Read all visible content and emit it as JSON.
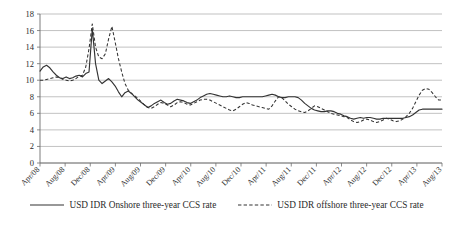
{
  "chart_data": {
    "type": "line",
    "title": "",
    "subtitle": "",
    "xlabel": "",
    "ylabel": "",
    "ylim": [
      0,
      18
    ],
    "ytick_step": 2,
    "yticks": [
      "0",
      "2",
      "4",
      "6",
      "8",
      "10",
      "12",
      "14",
      "16",
      "18"
    ],
    "grid": true,
    "grid_axis": "y",
    "legend_position": "bottom-center",
    "x_tick_labels": [
      "Apr/08",
      "Aug/08",
      "Dec/08",
      "Apr/09",
      "Aug/09",
      "Dec/09",
      "Apr/10",
      "Aug/10",
      "Dec/10",
      "Apr/11",
      "Aug/11",
      "Dec/11",
      "Apr/12",
      "Aug/12",
      "Dec/12",
      "Apr/13",
      "Aug/13"
    ],
    "x_tick_interval_months": 4,
    "x_start": "Apr/08",
    "x_end": "Aug/13",
    "series": [
      {
        "name": "USD IDR Onshore three-year CCS rate",
        "style": "solid",
        "color": "#333333",
        "values": [
          11.1,
          11.6,
          11.8,
          11.5,
          11.0,
          10.6,
          10.3,
          10.2,
          10.4,
          10.2,
          10.3,
          10.5,
          10.6,
          10.4,
          10.8,
          11.0,
          16.2,
          12.0,
          10.0,
          9.6,
          9.9,
          10.2,
          9.8,
          9.3,
          8.6,
          8.0,
          8.5,
          8.7,
          8.4,
          8.0,
          7.6,
          7.3,
          7.0,
          6.7,
          6.9,
          7.2,
          7.4,
          7.6,
          7.3,
          7.1,
          7.2,
          7.5,
          7.7,
          7.6,
          7.5,
          7.3,
          7.2,
          7.4,
          7.6,
          7.9,
          8.1,
          8.3,
          8.4,
          8.3,
          8.2,
          8.1,
          8.0,
          8.0,
          8.1,
          8.0,
          7.9,
          7.9,
          8.0,
          8.0,
          8.0,
          8.0,
          8.0,
          8.0,
          8.0,
          8.1,
          8.2,
          8.3,
          8.2,
          8.0,
          7.9,
          7.9,
          8.0,
          8.0,
          8.0,
          7.9,
          7.6,
          7.2,
          6.9,
          6.6,
          6.4,
          6.3,
          6.2,
          6.2,
          6.3,
          6.3,
          6.2,
          6.0,
          5.9,
          5.7,
          5.6,
          5.4,
          5.3,
          5.4,
          5.5,
          5.4,
          5.5,
          5.5,
          5.4,
          5.3,
          5.3,
          5.4,
          5.4,
          5.4,
          5.4,
          5.4,
          5.4,
          5.4,
          5.5,
          5.6,
          5.8,
          6.1,
          6.4,
          6.5,
          6.5,
          6.5,
          6.5,
          6.5,
          6.5,
          6.5
        ]
      },
      {
        "name": "USD IDR offshore three-year CCS rate",
        "style": "dashed",
        "color": "#333333",
        "values": [
          10.0,
          10.0,
          10.1,
          10.2,
          10.3,
          10.4,
          10.3,
          10.1,
          10.0,
          9.9,
          10.0,
          10.2,
          10.5,
          10.6,
          11.6,
          13.8,
          16.8,
          14.0,
          12.8,
          12.6,
          13.2,
          15.0,
          16.5,
          14.6,
          12.6,
          11.0,
          9.6,
          8.8,
          8.4,
          8.1,
          7.8,
          7.4,
          7.0,
          6.7,
          6.6,
          6.8,
          7.1,
          7.3,
          7.2,
          7.0,
          6.8,
          7.0,
          7.3,
          7.4,
          7.3,
          7.1,
          7.0,
          7.2,
          7.4,
          7.6,
          7.7,
          7.7,
          7.6,
          7.4,
          7.2,
          7.0,
          6.8,
          6.6,
          6.4,
          6.3,
          6.5,
          6.8,
          7.1,
          7.3,
          7.2,
          7.0,
          6.9,
          6.8,
          6.7,
          6.6,
          6.5,
          6.9,
          7.5,
          8.0,
          7.9,
          7.5,
          7.1,
          6.8,
          6.5,
          6.3,
          6.2,
          6.1,
          6.3,
          6.6,
          6.9,
          6.8,
          6.6,
          6.4,
          6.2,
          6.0,
          5.9,
          5.8,
          5.7,
          5.6,
          5.5,
          5.2,
          5.0,
          4.9,
          5.0,
          5.2,
          5.3,
          5.2,
          5.0,
          4.9,
          5.0,
          5.2,
          5.4,
          5.3,
          5.1,
          5.0,
          5.1,
          5.3,
          5.6,
          6.0,
          6.6,
          7.4,
          8.2,
          8.8,
          9.0,
          8.9,
          8.5,
          8.0,
          7.6,
          7.6
        ]
      }
    ]
  },
  "legend": {
    "entries": [
      {
        "label": "USD IDR Onshore three-year CCS rate",
        "style": "solid",
        "swatch_name": "solid-line-swatch"
      },
      {
        "label": "USD IDR offshore three-year CCS rate",
        "style": "dashed",
        "swatch_name": "dashed-line-swatch"
      }
    ]
  }
}
